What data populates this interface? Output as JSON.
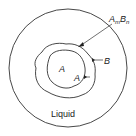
{
  "diagram": {
    "type": "phase-diagram-schematic",
    "regions": {
      "inner_core": "A",
      "outer_shell": "B",
      "surroundings": "Liquid"
    },
    "labels": {
      "compound": "AmBn",
      "compound_base_a": "A",
      "compound_sub_m": "m",
      "compound_base_b": "B",
      "compound_sub_n": "n",
      "b_arrow": "B",
      "a_center": "A",
      "a_arrow": "A",
      "liquid": "Liquid"
    },
    "colors": {
      "line": "#333333",
      "background": "#ffffff"
    }
  }
}
